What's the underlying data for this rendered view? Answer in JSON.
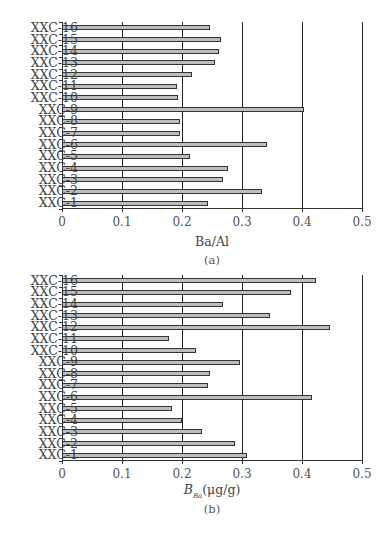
{
  "chart_data": [
    {
      "type": "bar",
      "orientation": "horizontal",
      "title": "",
      "caption": "(a)",
      "xlabel": "Ba/Al",
      "ylabel": "",
      "xlim": [
        0,
        0.5
      ],
      "xticks": [
        "0",
        "0.1",
        "0.2",
        "0.3",
        "0.4",
        "0.5"
      ],
      "grid": "vertical major gridlines",
      "categories": [
        "XXC-1",
        "XXC-2",
        "XXC-3",
        "XXC-4",
        "XXC-5",
        "XXC-6",
        "XXC-7",
        "XXC-8",
        "XXC-9",
        "XXC-10",
        "XXC-11",
        "XXC-12",
        "XXC-13",
        "XXC-14",
        "XXC-15",
        "XXC-16"
      ],
      "values": [
        0.244,
        0.334,
        0.268,
        0.276,
        0.214,
        0.341,
        0.197,
        0.196,
        0.403,
        0.193,
        0.192,
        0.217,
        0.255,
        0.261,
        0.265,
        0.246
      ],
      "bar_color": "#bdbdbd"
    },
    {
      "type": "bar",
      "orientation": "horizontal",
      "title": "",
      "caption": "(b)",
      "xlabel": "B_Ba(μg/g)",
      "xlabel_main": "B",
      "xlabel_sub": "Ba",
      "xlabel_unit": "(μg/g)",
      "ylabel": "",
      "xlim": [
        0,
        0.5
      ],
      "xticks": [
        "0",
        "0.1",
        "0.2",
        "0.3",
        "0.4",
        "0.5"
      ],
      "grid": "vertical major gridlines",
      "categories": [
        "XXC-1",
        "XXC-2",
        "XXC-3",
        "XXC-4",
        "XXC-5",
        "XXC-6",
        "XXC-7",
        "XXC-8",
        "XXC-9",
        "XXC-10",
        "XXC-11",
        "XXC-12",
        "XXC-13",
        "XXC-14",
        "XXC-15",
        "XXC-16"
      ],
      "values": [
        0.309,
        0.289,
        0.233,
        0.2,
        0.184,
        0.416,
        0.243,
        0.246,
        0.296,
        0.223,
        0.178,
        0.446,
        0.347,
        0.268,
        0.381,
        0.423
      ],
      "bar_color": "#bdbdbd"
    }
  ]
}
